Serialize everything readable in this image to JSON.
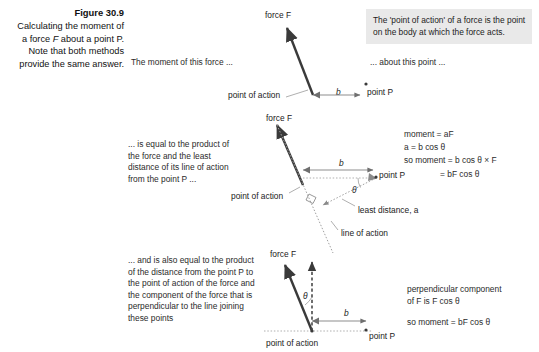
{
  "caption": {
    "title": "Figure 30.9",
    "line1": "Calculating the moment of",
    "line2_pre": "a force ",
    "line2_it": "F",
    "line2_post": " about a point P.",
    "line3": "Note that both methods",
    "line4": "provide the same answer."
  },
  "callout": {
    "line1": "The 'point of action' of a force is the point",
    "line2": "on the body at which the force acts.",
    "background": "#e9e9e9"
  },
  "panel_top": {
    "note_left": "The moment of this force ...",
    "note_right": "... about this point ...",
    "label_force": "force F",
    "label_point_of_action": "point of action",
    "label_point_p": "point P",
    "label_b": "b"
  },
  "panel_middle": {
    "note": {
      "line1": "... is equal to the product of",
      "line2": "the force and the least",
      "line3": "distance of its line of action",
      "line4": "from the point P ..."
    },
    "label_force": "force F",
    "label_point_of_action": "point of action",
    "label_point_p": "point P",
    "label_b": "b",
    "label_theta": "θ",
    "label_least_distance": "least distance, a",
    "label_line_of_action": "line of action",
    "equations": {
      "eq1": "moment = aF",
      "eq2": "a = b cos θ",
      "eq3": "so moment = b cos θ × F",
      "eq4": "= bF cos θ"
    }
  },
  "panel_bottom": {
    "note": {
      "line1": "... and is also equal to the product",
      "line2": "of the distance from the point P to",
      "line3": "the point of action of the force and",
      "line4": "the component of the force that is",
      "line5": "perpendicular to the line joining",
      "line6": "these points"
    },
    "label_force": "force F",
    "label_point_of_action": "point of action",
    "label_point_p": "point P",
    "label_b": "b",
    "label_theta": "θ",
    "text_right": {
      "line1": "perpendicular component",
      "line2": "of F is F cos θ",
      "line3": "so moment = bF cos θ"
    }
  },
  "colors": {
    "force_arrow": "#3a3a3a",
    "thin_line": "#8d8d8d",
    "dotted": "#9a9a9a",
    "text": "#222222"
  }
}
